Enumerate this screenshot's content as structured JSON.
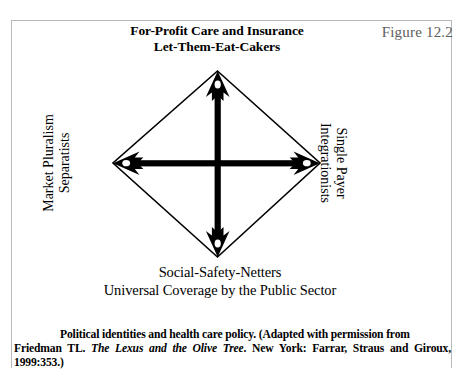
{
  "figure": {
    "number": "Figure 12.2",
    "top_label_line1": "For-Profit Care and Insurance",
    "top_label_line2": "Let-Them-Eat-Cakers",
    "bottom_label_line1": "Social-Safety-Netters",
    "bottom_label_line2": "Universal Coverage by the Public Sector",
    "left_label_line1": "Market Pluralism",
    "left_label_line2": "Separatists",
    "right_label_line1": "Single Payer",
    "right_label_line2": "Integrationists"
  },
  "caption": {
    "lead": "Political identities and health care policy. (Adapted with permission from",
    "author": "Friedman TL.",
    "book_title": "The Lexus and the Olive Tree",
    "publication": ". New York: Farrar, Straus and Giroux, 1999:353.)"
  },
  "colors": {
    "ink": "#000000",
    "frame": "#b9b9b9",
    "figure_number": "#5d5d5d",
    "page": "#ffffff"
  }
}
